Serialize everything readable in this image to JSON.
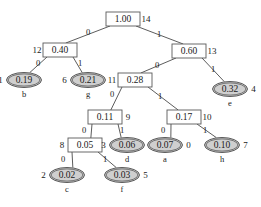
{
  "diagram": {
    "colors": {
      "leaf_fill": "#cfcfcf",
      "internal_fill": "#ffffff",
      "stroke": "#4a4a4a",
      "background": "#ffffff"
    },
    "nodes": [
      {
        "id": "n14",
        "value": "1.00",
        "index": "14",
        "shape": "box",
        "cx": 123,
        "cy": 19,
        "index_side": "right",
        "letter": ""
      },
      {
        "id": "n12",
        "value": "0.40",
        "index": "12",
        "shape": "box",
        "cx": 60,
        "cy": 50,
        "index_side": "left",
        "letter": ""
      },
      {
        "id": "n13",
        "value": "0.60",
        "index": "13",
        "shape": "box",
        "cx": 189,
        "cy": 51,
        "index_side": "right",
        "letter": ""
      },
      {
        "id": "n1",
        "value": "0.19",
        "index": "1",
        "shape": "ellipse",
        "cx": 24,
        "cy": 80,
        "index_side": "left",
        "letter": "b"
      },
      {
        "id": "n6",
        "value": "0.21",
        "index": "6",
        "shape": "ellipse",
        "cx": 88,
        "cy": 80,
        "index_side": "left",
        "letter": "g"
      },
      {
        "id": "n11",
        "value": "0.28",
        "index": "11",
        "shape": "box",
        "cx": 135,
        "cy": 80,
        "index_side": "left",
        "letter": ""
      },
      {
        "id": "n4",
        "value": "0.32",
        "index": "4",
        "shape": "ellipse",
        "cx": 230,
        "cy": 89,
        "index_side": "right",
        "letter": "e"
      },
      {
        "id": "n9",
        "value": "0.11",
        "index": "9",
        "shape": "box",
        "cx": 105,
        "cy": 117,
        "index_side": "right",
        "letter": ""
      },
      {
        "id": "n10",
        "value": "0.17",
        "index": "10",
        "shape": "box",
        "cx": 184,
        "cy": 117,
        "index_side": "right",
        "letter": ""
      },
      {
        "id": "n8",
        "value": "0.05",
        "index": "8",
        "shape": "box",
        "cx": 85,
        "cy": 145,
        "index_side": "left",
        "letter": ""
      },
      {
        "id": "n3",
        "value": "0.06",
        "index": "3",
        "shape": "ellipse",
        "cx": 127,
        "cy": 145,
        "index_side": "left",
        "letter": "d"
      },
      {
        "id": "n0",
        "value": "0.07",
        "index": "0",
        "shape": "ellipse",
        "cx": 165,
        "cy": 145,
        "index_side": "right",
        "letter": "a"
      },
      {
        "id": "n7",
        "value": "0.10",
        "index": "7",
        "shape": "ellipse",
        "cx": 222,
        "cy": 145,
        "index_side": "right",
        "letter": "h"
      },
      {
        "id": "n2",
        "value": "0.02",
        "index": "2",
        "shape": "ellipse",
        "cx": 67,
        "cy": 175,
        "index_side": "left",
        "letter": "c"
      },
      {
        "id": "n5",
        "value": "0.03",
        "index": "5",
        "shape": "ellipse",
        "cx": 122,
        "cy": 175,
        "index_side": "right",
        "letter": "f"
      }
    ],
    "edges": [
      {
        "from": "n14",
        "to": "n12",
        "label": "0",
        "lx": 88,
        "ly": 33
      },
      {
        "from": "n14",
        "to": "n13",
        "label": "1",
        "lx": 159,
        "ly": 35
      },
      {
        "from": "n12",
        "to": "n1",
        "label": "0",
        "lx": 38,
        "ly": 64
      },
      {
        "from": "n12",
        "to": "n6",
        "label": "1",
        "lx": 80,
        "ly": 64
      },
      {
        "from": "n13",
        "to": "n11",
        "label": "0",
        "lx": 157,
        "ly": 66
      },
      {
        "from": "n13",
        "to": "n4",
        "label": "1",
        "lx": 213,
        "ly": 70
      },
      {
        "from": "n11",
        "to": "n9",
        "label": "0",
        "lx": 112,
        "ly": 95
      },
      {
        "from": "n11",
        "to": "n10",
        "label": "1",
        "lx": 160,
        "ly": 97
      },
      {
        "from": "n9",
        "to": "n8",
        "label": "0",
        "lx": 84,
        "ly": 131
      },
      {
        "from": "n9",
        "to": "n3",
        "label": "1",
        "lx": 122,
        "ly": 131
      },
      {
        "from": "n10",
        "to": "n0",
        "label": "0",
        "lx": 163,
        "ly": 131
      },
      {
        "from": "n10",
        "to": "n7",
        "label": "1",
        "lx": 205,
        "ly": 131
      },
      {
        "from": "n8",
        "to": "n2",
        "label": "0",
        "lx": 63,
        "ly": 160
      },
      {
        "from": "n8",
        "to": "n5",
        "label": "1",
        "lx": 105,
        "ly": 160
      }
    ]
  }
}
